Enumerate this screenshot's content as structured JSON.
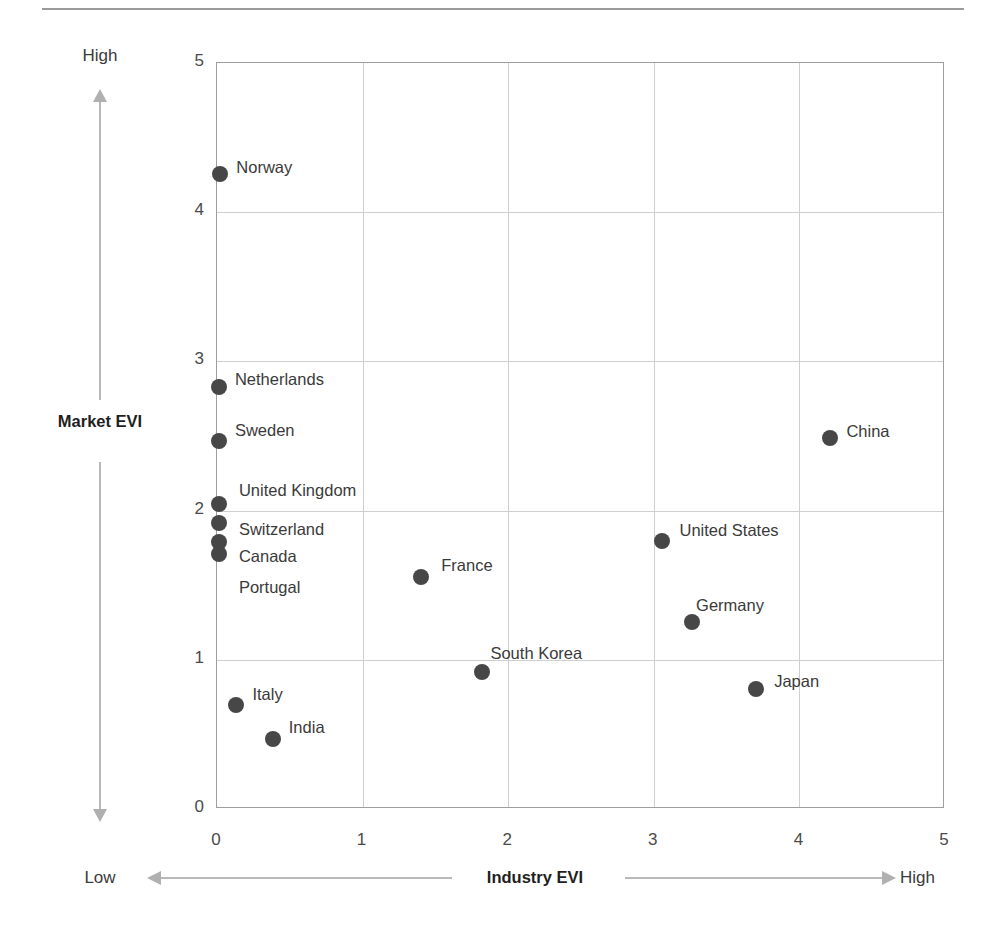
{
  "chart_data": {
    "type": "scatter",
    "title": "",
    "xlabel": "Industry EVI",
    "ylabel": "Market EVI",
    "xlim": [
      0,
      5
    ],
    "ylim": [
      0,
      5
    ],
    "xticks": [
      "0",
      "1",
      "2",
      "3",
      "4",
      "5"
    ],
    "yticks": [
      "0",
      "1",
      "2",
      "3",
      "4",
      "5"
    ],
    "grid": true,
    "legend": "none",
    "x_axis_low_label": "Low",
    "x_axis_high_label": "High",
    "y_axis_high_label": "High",
    "marker_color": "#474747",
    "grid_color": "#cfcfcf",
    "frame_color": "#9e9e9e",
    "points": [
      {
        "label": "Norway",
        "x": 0.03,
        "y": 4.25,
        "label_dx": 16,
        "label_dy": -16
      },
      {
        "label": "Netherlands",
        "x": 0.02,
        "y": 2.82,
        "label_dx": 16,
        "label_dy": -17
      },
      {
        "label": "Sweden",
        "x": 0.02,
        "y": 2.46,
        "label_dx": 16,
        "label_dy": -20
      },
      {
        "label": "China",
        "x": 4.22,
        "y": 2.48,
        "label_dx": 16,
        "label_dy": -16
      },
      {
        "label": "United Kingdom",
        "x": 0.02,
        "y": 2.04,
        "label_dx": 20,
        "label_dy": -23
      },
      {
        "label": "Switzerland",
        "x": 0.02,
        "y": 1.91,
        "label_dx": 20,
        "label_dy": -3
      },
      {
        "label": "United States",
        "x": 3.06,
        "y": 1.79,
        "label_dx": 18,
        "label_dy": -20
      },
      {
        "label": "Canada",
        "x": 0.02,
        "y": 1.78,
        "label_dx": 20,
        "label_dy": 5
      },
      {
        "label": "Portugal",
        "x": 0.02,
        "y": 1.7,
        "label_dx": 20,
        "label_dy": 24
      },
      {
        "label": "France",
        "x": 1.41,
        "y": 1.55,
        "label_dx": 20,
        "label_dy": -21
      },
      {
        "label": "Germany",
        "x": 3.27,
        "y": 1.25,
        "label_dx": 4,
        "label_dy": -26
      },
      {
        "label": "South Korea",
        "x": 1.83,
        "y": 0.91,
        "label_dx": 8,
        "label_dy": -28
      },
      {
        "label": "Japan",
        "x": 3.71,
        "y": 0.8,
        "label_dx": 18,
        "label_dy": -17
      },
      {
        "label": "Italy",
        "x": 0.14,
        "y": 0.69,
        "label_dx": 16,
        "label_dy": -20
      },
      {
        "label": "India",
        "x": 0.39,
        "y": 0.46,
        "label_dx": 16,
        "label_dy": -21
      }
    ]
  }
}
